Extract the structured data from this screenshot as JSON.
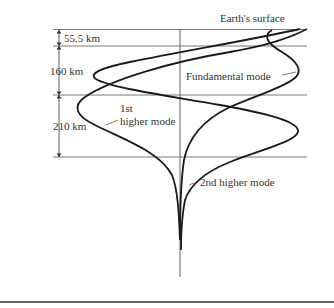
{
  "diagram": {
    "surface_label": "Earth's surface",
    "layers": [
      {
        "thickness_label": "55.5 km"
      },
      {
        "thickness_label": "160 km"
      },
      {
        "thickness_label": "210 km"
      }
    ],
    "modes": [
      {
        "name": "fundamental",
        "label": "Fundamental mode"
      },
      {
        "name": "first-higher",
        "label_line1": "1st",
        "label_line2": "higher mode"
      },
      {
        "name": "second-higher",
        "label": "2nd higher mode"
      }
    ],
    "colors": {
      "curve": "#1a1a1a",
      "grid": "#6a6a6a",
      "text": "#333333",
      "background": "#ffffff"
    }
  }
}
